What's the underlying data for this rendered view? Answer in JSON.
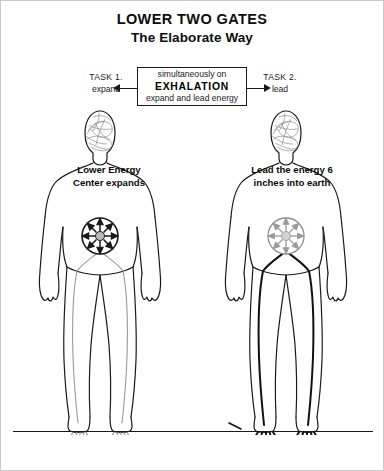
{
  "page": {
    "title_main": "LOWER TWO GATES",
    "title_sub": "The Elaborate Way",
    "background_color": "#ffffff",
    "ink_color": "#1a1a1a",
    "faint_ink_color": "#9a9a9a"
  },
  "exhalation_box": {
    "line1": "simultaneously on",
    "line2": "EXHALATION",
    "line3": "expand and lead energy"
  },
  "tasks": [
    {
      "id": "task-1",
      "label": "TASK 1.",
      "action": "expand",
      "arrow": "arrow-left"
    },
    {
      "id": "task-2",
      "label": "TASK 2.",
      "action": "lead",
      "arrow": "arrow-right"
    }
  ],
  "figures": [
    {
      "id": "figure-left",
      "caption": "Lower Energy Center expands",
      "wheel": {
        "name": "chakra-wheel-icon",
        "direction": "outward",
        "color": "#1a1a1a"
      },
      "energy_lines_color": "#9a9a9a",
      "roots_color": "#9a9a9a"
    },
    {
      "id": "figure-right",
      "caption": "Lead the energy 6 inches into earth",
      "wheel": {
        "name": "chakra-wheel-icon",
        "direction": "inward",
        "color": "#9a9a9a"
      },
      "energy_lines_color": "#111111",
      "roots_color": "#111111"
    }
  ],
  "ground": {
    "name": "earth-line",
    "label": ""
  }
}
